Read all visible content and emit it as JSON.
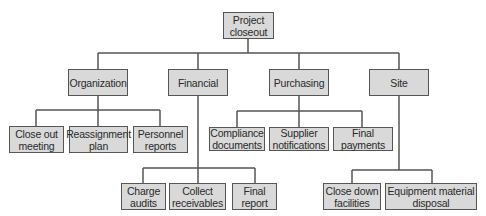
{
  "diagram": {
    "type": "hierarchy-tree",
    "colors": {
      "box_fill": "#d9d9d9",
      "box_border": "#555555",
      "line": "#555555",
      "text": "#2a2a2a"
    },
    "root": {
      "id": "project-closeout",
      "label": "Project\ncloseout"
    },
    "branches": [
      {
        "id": "organization",
        "label": "Organization",
        "children": [
          {
            "id": "close-out-meeting",
            "label": "Close out\nmeeting"
          },
          {
            "id": "reassignment-plan",
            "label": "Reassignment\nplan"
          },
          {
            "id": "personnel-reports",
            "label": "Personnel\nreports"
          }
        ]
      },
      {
        "id": "financial",
        "label": "Financial",
        "children": [
          {
            "id": "charge-audits",
            "label": "Charge\naudits"
          },
          {
            "id": "collect-receivables",
            "label": "Collect\nreceivables"
          },
          {
            "id": "final-report",
            "label": "Final\nreport"
          }
        ]
      },
      {
        "id": "purchasing",
        "label": "Purchasing",
        "children": [
          {
            "id": "compliance-documents",
            "label": "Compliance\ndocuments"
          },
          {
            "id": "supplier-notifications",
            "label": "Supplier\nnotifications"
          },
          {
            "id": "final-payments",
            "label": "Final\npayments"
          }
        ]
      },
      {
        "id": "site",
        "label": "Site",
        "children": [
          {
            "id": "close-down-facilities",
            "label": "Close down\nfacilities"
          },
          {
            "id": "equipment-material-disposal",
            "label": "Equipment material\ndisposal"
          }
        ]
      }
    ]
  }
}
